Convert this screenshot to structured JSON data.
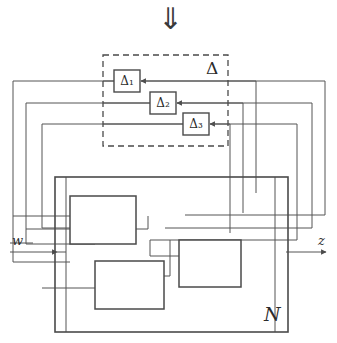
{
  "figure": {
    "title_arrow": "⇓",
    "arrow_icon_name": "double-down-arrow-icon",
    "stroke_color": "#555555",
    "block_stroke_color": "#4a4a4a",
    "text_color": "#2b2b2b",
    "background": "#ffffff",
    "width": 337,
    "height": 343
  },
  "uncertainty": {
    "label": "Δ",
    "boundary_style": "dashed",
    "blocks": [
      {
        "label": "Δ₁",
        "x": 114,
        "y": 70,
        "w": 26,
        "h": 22
      },
      {
        "label": "Δ₂",
        "x": 150,
        "y": 92,
        "w": 26,
        "h": 22
      },
      {
        "label": "Δ₃",
        "x": 183,
        "y": 113,
        "w": 26,
        "h": 22
      }
    ],
    "box": {
      "x": 103,
      "y": 55,
      "w": 125,
      "h": 91
    }
  },
  "plant": {
    "label": "N",
    "box": {
      "x": 55,
      "y": 177,
      "w": 233,
      "h": 155
    },
    "subsystems": [
      {
        "name": "subsystem-1",
        "x": 70,
        "y": 196,
        "w": 66,
        "h": 48
      },
      {
        "name": "subsystem-2",
        "x": 179,
        "y": 240,
        "w": 62,
        "h": 47
      },
      {
        "name": "subsystem-3",
        "x": 95,
        "y": 261,
        "w": 69,
        "h": 48
      }
    ]
  },
  "signals": {
    "input": {
      "label": "w",
      "name": "input-signal-w"
    },
    "output": {
      "label": "z",
      "name": "output-signal-z"
    }
  },
  "feedback_loops": [
    {
      "name": "feedback-loop-1",
      "target": "Δ₁",
      "left_x": 13,
      "right_x": 325,
      "y": 81
    },
    {
      "name": "feedback-loop-2",
      "target": "Δ₂",
      "left_x": 26,
      "right_x": 312,
      "y": 103
    },
    {
      "name": "feedback-loop-3",
      "target": "Δ₃",
      "left_x": 42,
      "right_x": 297,
      "y": 124
    }
  ]
}
